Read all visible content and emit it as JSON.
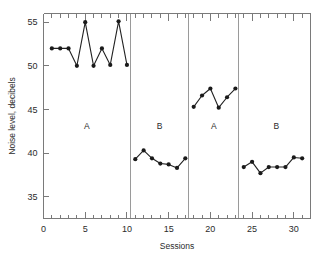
{
  "chart_data": {
    "type": "line",
    "title": "",
    "xlabel": "Sessions",
    "ylabel": "Noise level, decibels",
    "xlim": [
      0,
      32
    ],
    "ylim": [
      32.5,
      56
    ],
    "grid": false,
    "legend": "none",
    "xticks": [
      0,
      5,
      10,
      15,
      20,
      25,
      30
    ],
    "xtick_labels": [
      "0",
      "5",
      "10",
      "15",
      "20",
      "25",
      "30"
    ],
    "xminor_step": 1,
    "yticks": [
      35,
      40,
      45,
      50,
      55
    ],
    "ytick_labels": [
      "35",
      "40",
      "45",
      "50",
      "55"
    ],
    "phases": [
      {
        "label": "A",
        "x_start": 0.0,
        "x_end": 10.4,
        "label_x": 5.2,
        "label_y": 42.8
      },
      {
        "label": "B",
        "x_start": 10.4,
        "x_end": 17.4,
        "label_x": 13.9,
        "label_y": 42.8
      },
      {
        "label": "A",
        "x_start": 17.4,
        "x_end": 23.4,
        "label_x": 20.4,
        "label_y": 42.8
      },
      {
        "label": "B",
        "x_start": 23.4,
        "x_end": 32.0,
        "label_x": 27.9,
        "label_y": 42.8
      }
    ],
    "phase_dividers": [
      10.4,
      17.4,
      23.4
    ],
    "series": [
      {
        "name": "Noise level",
        "x": [
          1,
          2,
          3,
          4,
          5,
          6,
          7,
          8,
          9,
          10,
          11,
          12,
          13,
          14,
          15,
          16,
          17,
          18,
          19,
          20,
          21,
          22,
          23,
          24,
          25,
          26,
          27,
          28,
          29,
          30,
          31
        ],
        "values": [
          52.0,
          52.0,
          52.0,
          50.0,
          55.0,
          50.0,
          52.0,
          50.1,
          55.1,
          50.1,
          39.3,
          40.3,
          39.4,
          38.8,
          38.7,
          38.3,
          39.4,
          45.3,
          46.6,
          47.4,
          45.2,
          46.4,
          47.4,
          38.4,
          39.0,
          37.7,
          38.4,
          38.4,
          38.4,
          39.5,
          39.4
        ]
      }
    ]
  }
}
